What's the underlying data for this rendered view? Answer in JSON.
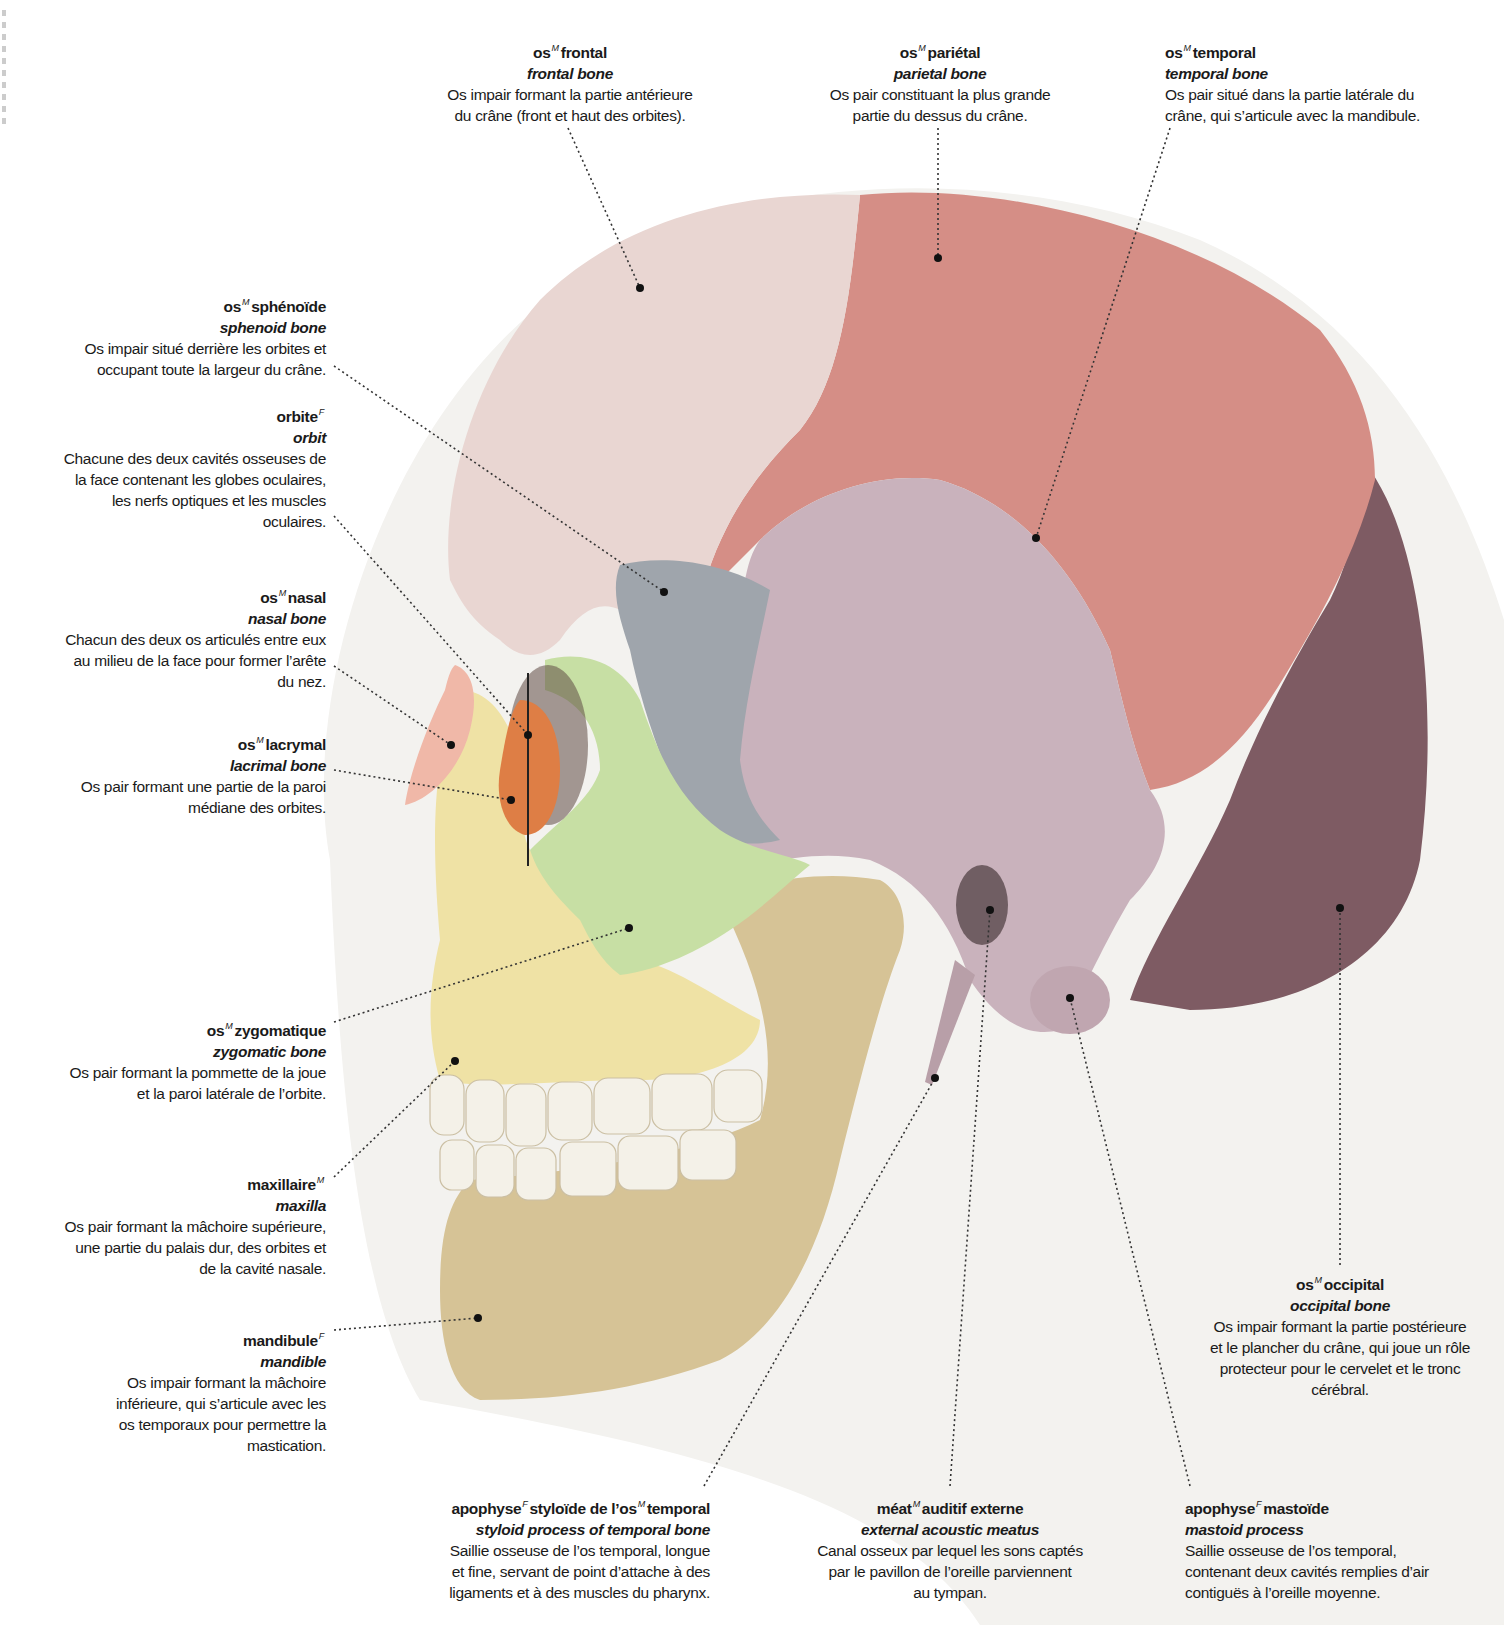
{
  "illustration": {
    "title": "Crâne humain, vue latérale",
    "colors": {
      "frontal": "#e9d6d2",
      "parietal": "#d58e86",
      "temporal": "#c9b2bc",
      "occipital": "#7e5b63",
      "sphenoid": "#9fa5ac",
      "zygomatic": "#c7dfa4",
      "maxilla": "#efe2a5",
      "mandible": "#d6c396",
      "nasal": "#f0b8a8",
      "lacrimal": "#de7e45",
      "teeth": "#f4f1e8",
      "background_head": "#f2f1ee",
      "leader": "#333333"
    }
  },
  "labels": [
    {
      "id": "frontal",
      "gender": "M",
      "fr_prefix": "os",
      "fr": "frontal",
      "en": "frontal bone",
      "desc": [
        "Os impair formant la partie antérieure",
        "du crâne (front et haut des orbites)."
      ]
    },
    {
      "id": "parietal",
      "gender": "M",
      "fr_prefix": "os",
      "fr": "pariétal",
      "en": "parietal bone",
      "desc": [
        "Os pair constituant la plus grande",
        "partie du dessus du crâne."
      ]
    },
    {
      "id": "temporal",
      "gender": "M",
      "fr_prefix": "os",
      "fr": "temporal",
      "en": "temporal bone",
      "desc": [
        "Os pair situé dans la partie latérale du",
        "crâne, qui s’articule avec la mandibule."
      ]
    },
    {
      "id": "sphenoid",
      "gender": "M",
      "fr_prefix": "os",
      "fr": "sphénoïde",
      "en": "sphenoid bone",
      "desc": [
        "Os impair situé derrière les orbites et",
        "occupant toute la largeur du crâne."
      ]
    },
    {
      "id": "orbit",
      "gender": "F",
      "fr_prefix": "",
      "fr": "orbite",
      "en": "orbit",
      "desc": [
        "Chacune des deux cavités osseuses de",
        "la face contenant les globes oculaires,",
        "les nerfs optiques et les muscles",
        "oculaires."
      ]
    },
    {
      "id": "nasal",
      "gender": "M",
      "fr_prefix": "os",
      "fr": "nasal",
      "en": "nasal bone",
      "desc": [
        "Chacun des deux os articulés entre eux",
        "au milieu de la face pour former l’arête",
        "du nez."
      ]
    },
    {
      "id": "lacrimal",
      "gender": "M",
      "fr_prefix": "os",
      "fr": "lacrymal",
      "en": "lacrimal bone",
      "desc": [
        "Os pair formant une partie de la paroi",
        "médiane des orbites."
      ]
    },
    {
      "id": "zygomatic",
      "gender": "M",
      "fr_prefix": "os",
      "fr": "zygomatique",
      "en": "zygomatic bone",
      "desc": [
        "Os pair formant la pommette de la joue",
        "et la paroi latérale de l’orbite."
      ]
    },
    {
      "id": "maxilla",
      "gender": "M",
      "fr_prefix": "",
      "fr": "maxillaire",
      "en": "maxilla",
      "desc": [
        "Os pair formant la mâchoire supérieure,",
        "une partie du palais dur, des orbites et",
        "de la cavité nasale."
      ]
    },
    {
      "id": "mandible",
      "gender": "F",
      "fr_prefix": "",
      "fr": "mandibule",
      "en": "mandible",
      "desc": [
        "Os impair formant la mâchoire",
        "inférieure, qui s’articule avec les",
        "os temporaux pour permettre la",
        "mastication."
      ]
    },
    {
      "id": "occipital",
      "gender": "M",
      "fr_prefix": "os",
      "fr": "occipital",
      "en": "occipital bone",
      "desc": [
        "Os impair formant la partie postérieure",
        "et le plancher du crâne, qui joue un rôle",
        "protecteur pour le cervelet et le tronc",
        "cérébral."
      ]
    },
    {
      "id": "styloid",
      "gender": "F",
      "gender2": "M",
      "fr_prefix": "apophyse",
      "fr": "styloïde de l’os",
      "fr_suffix": "temporal",
      "en": "styloid process of temporal bone",
      "desc": [
        "Saillie osseuse de l’os temporal, longue",
        "et fine, servant de point d’attache à des",
        "ligaments et à des muscles du pharynx."
      ]
    },
    {
      "id": "meatus",
      "gender": "M",
      "fr_prefix": "méat",
      "fr": "auditif externe",
      "en": "external acoustic meatus",
      "desc": [
        "Canal osseux par lequel les sons captés",
        "par le pavillon de l’oreille parviennent",
        "au tympan."
      ]
    },
    {
      "id": "mastoid",
      "gender": "F",
      "fr_prefix": "apophyse",
      "fr": "mastoïde",
      "en": "mastoid process",
      "desc": [
        "Saillie osseuse de l’os temporal,",
        "contenant deux cavités remplies d’air",
        "contiguës à l’oreille moyenne."
      ]
    }
  ]
}
